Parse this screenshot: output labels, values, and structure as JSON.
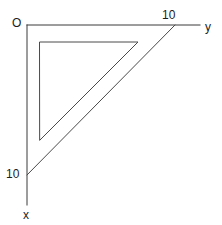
{
  "diagram": {
    "type": "geometry-figure",
    "background_color": "#ffffff",
    "stroke_color": "#3a3a3a",
    "text_color": "#1c1c1c",
    "labels": {
      "origin": "O",
      "y_axis": "y",
      "x_axis": "x",
      "y_tick_value": "10",
      "x_tick_value": "10"
    },
    "axes": {
      "origin_point": [
        27,
        25
      ],
      "x_axis_end": [
        27,
        205
      ],
      "y_axis_end": [
        200,
        25
      ],
      "x_tick_point": [
        27,
        175
      ],
      "y_tick_point": [
        175,
        25
      ]
    },
    "outer_triangle": {
      "name": "outer-right-triangle",
      "vertices": [
        [
          27,
          25
        ],
        [
          27,
          175
        ],
        [
          175,
          25
        ]
      ],
      "right_angle_at": "origin",
      "leg_lengths": [
        "10",
        "10"
      ]
    },
    "inner_triangle": {
      "name": "inner-right-triangle",
      "vertices": [
        [
          40,
          42
        ],
        [
          138,
          42
        ],
        [
          40,
          140
        ]
      ],
      "right_angle_at": "top-left"
    }
  },
  "chart_data": {
    "type": "line",
    "title": "",
    "xlabel": "x",
    "ylabel": "y",
    "xlim": [
      0,
      10
    ],
    "ylim": [
      0,
      10
    ],
    "grid": false,
    "legend": "none",
    "annotations": [
      "O",
      "10",
      "10",
      "x",
      "y"
    ],
    "series": [
      {
        "name": "outer-triangle-hypotenuse",
        "x": [
          0,
          10
        ],
        "y": [
          10,
          0
        ]
      },
      {
        "name": "inner-triangle",
        "x": [
          0.9,
          7.5,
          0.9,
          0.9
        ],
        "y": [
          8.85,
          8.85,
          2.35,
          8.85
        ]
      }
    ]
  }
}
